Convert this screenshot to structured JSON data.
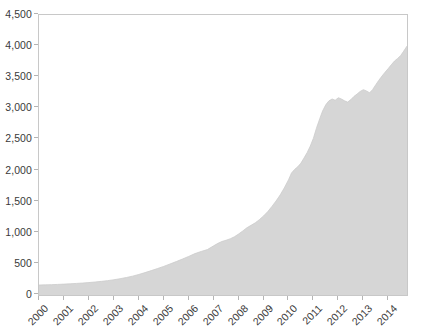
{
  "chart_data": {
    "type": "area",
    "title": "",
    "subtitle": "",
    "xlabel": "",
    "ylabel": "",
    "xlim": [
      2000,
      2014.75
    ],
    "ylim": [
      0,
      4500
    ],
    "grid": false,
    "legend": "none",
    "series_color": "#d6d6d6",
    "series_name": "",
    "y_ticks": [
      {
        "value": 4500,
        "label": "4,500"
      },
      {
        "value": 4000,
        "label": "4,000"
      },
      {
        "value": 3500,
        "label": "3,500"
      },
      {
        "value": 3000,
        "label": "3,000"
      },
      {
        "value": 2500,
        "label": "2,500"
      },
      {
        "value": 2000,
        "label": "2,000"
      },
      {
        "value": 1500,
        "label": "1,500"
      },
      {
        "value": 1000,
        "label": "1,000"
      },
      {
        "value": 500,
        "label": "500"
      },
      {
        "value": 0,
        "label": "0"
      }
    ],
    "x_ticks": [
      {
        "value": 2000,
        "label": "2000"
      },
      {
        "value": 2001,
        "label": "2001"
      },
      {
        "value": 2002,
        "label": "2002"
      },
      {
        "value": 2003,
        "label": "2003"
      },
      {
        "value": 2004,
        "label": "2004"
      },
      {
        "value": 2005,
        "label": "2005"
      },
      {
        "value": 2006,
        "label": "2006"
      },
      {
        "value": 2007,
        "label": "2007"
      },
      {
        "value": 2008,
        "label": "2008"
      },
      {
        "value": 2009,
        "label": "2009"
      },
      {
        "value": 2010,
        "label": "2010"
      },
      {
        "value": 2011,
        "label": "2011"
      },
      {
        "value": 2012,
        "label": "2012"
      },
      {
        "value": 2013,
        "label": "2013"
      },
      {
        "value": 2014,
        "label": "2014"
      }
    ],
    "x": [
      2000.0,
      2000.25,
      2000.5,
      2000.75,
      2001.0,
      2001.25,
      2001.5,
      2001.75,
      2002.0,
      2002.25,
      2002.5,
      2002.75,
      2003.0,
      2003.25,
      2003.5,
      2003.75,
      2004.0,
      2004.25,
      2004.5,
      2004.75,
      2005.0,
      2005.25,
      2005.5,
      2005.75,
      2006.0,
      2006.25,
      2006.5,
      2006.75,
      2007.0,
      2007.17,
      2007.33,
      2007.5,
      2007.67,
      2007.83,
      2008.0,
      2008.17,
      2008.33,
      2008.5,
      2008.67,
      2008.83,
      2009.0,
      2009.17,
      2009.33,
      2009.5,
      2009.67,
      2009.83,
      2010.0,
      2010.12,
      2010.25,
      2010.37,
      2010.5,
      2010.62,
      2010.75,
      2010.87,
      2011.0,
      2011.12,
      2011.25,
      2011.37,
      2011.5,
      2011.62,
      2011.75,
      2011.87,
      2012.0,
      2012.12,
      2012.25,
      2012.37,
      2012.5,
      2012.62,
      2012.75,
      2012.87,
      2013.0,
      2013.12,
      2013.25,
      2013.37,
      2013.5,
      2013.62,
      2013.75,
      2013.87,
      2014.0,
      2014.12,
      2014.25,
      2014.37,
      2014.5,
      2014.62,
      2014.75
    ],
    "values": [
      160,
      163,
      166,
      170,
      175,
      180,
      186,
      192,
      200,
      209,
      219,
      231,
      245,
      262,
      281,
      303,
      330,
      360,
      392,
      425,
      460,
      498,
      537,
      578,
      620,
      665,
      700,
      730,
      790,
      830,
      860,
      880,
      905,
      935,
      980,
      1030,
      1080,
      1120,
      1160,
      1210,
      1270,
      1340,
      1420,
      1510,
      1610,
      1720,
      1850,
      1960,
      2020,
      2060,
      2120,
      2200,
      2290,
      2390,
      2520,
      2680,
      2830,
      2960,
      3060,
      3120,
      3150,
      3130,
      3170,
      3150,
      3120,
      3100,
      3140,
      3190,
      3230,
      3270,
      3300,
      3280,
      3250,
      3300,
      3380,
      3450,
      3520,
      3580,
      3640,
      3700,
      3760,
      3800,
      3850,
      3920,
      4000
    ]
  }
}
